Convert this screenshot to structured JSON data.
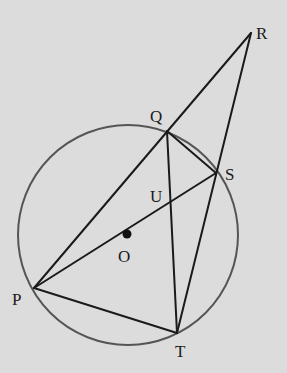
{
  "diagram": {
    "type": "circle-geometry",
    "background": "#dcdcdc",
    "stroke_color": "#1a1a1a",
    "circle": {
      "center_label": "O",
      "cx": 128,
      "cy": 235,
      "r": 110,
      "color": "#555555"
    },
    "points": {
      "R": {
        "label": "R",
        "x": 251,
        "y": 33
      },
      "Q": {
        "label": "Q",
        "x": 167,
        "y": 131
      },
      "S": {
        "label": "S",
        "x": 216,
        "y": 173
      },
      "U": {
        "label": "U",
        "x": 171,
        "y": 202
      },
      "O": {
        "label": "O",
        "x": 127,
        "y": 235
      },
      "P": {
        "label": "P",
        "x": 34,
        "y": 288
      },
      "T": {
        "label": "T",
        "x": 177,
        "y": 333
      }
    },
    "segments": [
      "PR",
      "PS",
      "QT",
      "QS",
      "RT",
      "PT"
    ]
  }
}
